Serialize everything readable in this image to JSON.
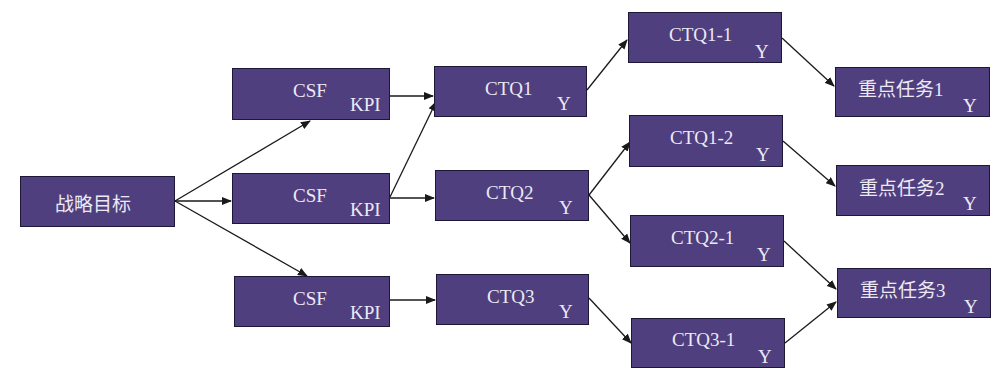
{
  "diagram": {
    "nodes": {
      "goal": {
        "label": "战略目标"
      },
      "csf1": {
        "label": "CSF",
        "sub": "KPI"
      },
      "csf2": {
        "label": "CSF",
        "sub": "KPI"
      },
      "csf3": {
        "label": "CSF",
        "sub": "KPI"
      },
      "ctq1": {
        "label": "CTQ1",
        "sub": "Y"
      },
      "ctq2": {
        "label": "CTQ2",
        "sub": "Y"
      },
      "ctq3": {
        "label": "CTQ3",
        "sub": "Y"
      },
      "ctq1_1": {
        "label": "CTQ1-1",
        "sub": "Y"
      },
      "ctq1_2": {
        "label": "CTQ1-2",
        "sub": "Y"
      },
      "ctq2_1": {
        "label": "CTQ2-1",
        "sub": "Y"
      },
      "ctq3_1": {
        "label": "CTQ3-1",
        "sub": "Y"
      },
      "task1": {
        "label": "重点任务1",
        "sub": "Y"
      },
      "task2": {
        "label": "重点任务2",
        "sub": "Y"
      },
      "task3": {
        "label": "重点任务3",
        "sub": "Y"
      }
    },
    "edges": [
      [
        "goal",
        "csf1"
      ],
      [
        "goal",
        "csf2"
      ],
      [
        "goal",
        "csf3"
      ],
      [
        "csf1",
        "ctq1"
      ],
      [
        "csf2",
        "ctq1"
      ],
      [
        "csf2",
        "ctq2"
      ],
      [
        "csf3",
        "ctq3"
      ],
      [
        "ctq1",
        "ctq1_1"
      ],
      [
        "ctq2",
        "ctq1_2"
      ],
      [
        "ctq2",
        "ctq2_1"
      ],
      [
        "ctq3",
        "ctq3_1"
      ],
      [
        "ctq1_1",
        "task1"
      ],
      [
        "ctq1_2",
        "task2"
      ],
      [
        "ctq2_1",
        "task3"
      ],
      [
        "ctq3_1",
        "task3"
      ]
    ],
    "colors": {
      "node_fill": "#4f3f7e",
      "node_border": "#1e1838",
      "node_text": "#ece9f4",
      "edge": "#1a1a1a"
    }
  }
}
